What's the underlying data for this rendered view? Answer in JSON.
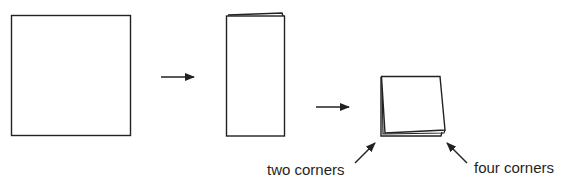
{
  "diagram": {
    "steps": [
      {
        "id": "step-1",
        "shape": "square",
        "state": "unfolded sheet"
      },
      {
        "id": "step-2",
        "shape": "rectangle",
        "state": "folded in half"
      },
      {
        "id": "step-3",
        "shape": "small-square",
        "state": "folded in quarters"
      }
    ],
    "labels": {
      "two_corners": "two corners",
      "four_corners": "four corners"
    },
    "colors": {
      "stroke": "#222222",
      "background": "#ffffff",
      "text": "#1f1f1f"
    }
  }
}
